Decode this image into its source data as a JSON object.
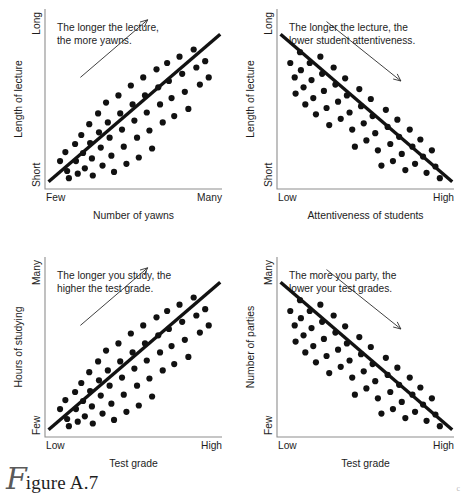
{
  "figure": {
    "caption_initial": "F",
    "caption_label": "igure A.7",
    "corner_mark": "c"
  },
  "panels": [
    {
      "id": "panel-length-vs-yawns",
      "caption_line1": "The longer the lecture,",
      "caption_line2": "the more yawns.",
      "y_axis_title": "Length of lecture",
      "y_top_label": "Long",
      "y_bottom_label": "Short",
      "x_axis_title": "Number of yawns",
      "x_left_label": "Few",
      "x_right_label": "Many",
      "direction": "positive",
      "arrow_name": "upward-trend-arrow"
    },
    {
      "id": "panel-length-vs-attentiveness",
      "caption_line1": "The longer the lecture, the",
      "caption_line2": "lower student attentiveness.",
      "y_axis_title": "Length of lecture",
      "y_top_label": "Long",
      "y_bottom_label": "Short",
      "x_axis_title": "Attentiveness of students",
      "x_left_label": "Low",
      "x_right_label": "High",
      "direction": "negative",
      "arrow_name": "downward-trend-arrow"
    },
    {
      "id": "panel-studying-vs-grade",
      "caption_line1": "The longer you study, the",
      "caption_line2": "higher the test grade.",
      "y_axis_title": "Hours of studying",
      "y_top_label": "Many",
      "y_bottom_label": "Few",
      "x_axis_title": "Test grade",
      "x_left_label": "Low",
      "x_right_label": "High",
      "direction": "positive",
      "arrow_name": "upward-trend-arrow"
    },
    {
      "id": "panel-parties-vs-grade",
      "caption_line1": "The more you party, the",
      "caption_line2": "lower your test grades.",
      "y_axis_title": "Number of parties",
      "y_top_label": "Many",
      "y_bottom_label": "Few",
      "x_axis_title": "Test grade",
      "x_left_label": "Low",
      "x_right_label": "High",
      "direction": "negative",
      "arrow_name": "downward-trend-arrow"
    }
  ],
  "chart_data": [
    {
      "type": "scatter",
      "title": "The longer the lecture, the more yawns.",
      "xlabel": "Number of yawns",
      "ylabel": "Length of lecture",
      "xlim": [
        0,
        1
      ],
      "ylim": [
        0,
        1
      ],
      "xtick_labels": [
        "Few",
        "Many"
      ],
      "ytick_labels": [
        "Short",
        "Long"
      ],
      "grid": false,
      "legend": "none",
      "correlation": "positive",
      "annotation": "upward arrow indicating positive correlation",
      "trendline": {
        "x": [
          0.02,
          0.99
        ],
        "y": [
          0.04,
          0.86
        ]
      },
      "points": [
        [
          0.085,
          0.155
        ],
        [
          0.115,
          0.205
        ],
        [
          0.125,
          0.1
        ],
        [
          0.135,
          0.06
        ],
        [
          0.17,
          0.25
        ],
        [
          0.175,
          0.155
        ],
        [
          0.185,
          0.085
        ],
        [
          0.205,
          0.3
        ],
        [
          0.215,
          0.2
        ],
        [
          0.225,
          0.115
        ],
        [
          0.25,
          0.36
        ],
        [
          0.255,
          0.255
        ],
        [
          0.265,
          0.17
        ],
        [
          0.27,
          0.075
        ],
        [
          0.3,
          0.42
        ],
        [
          0.305,
          0.315
        ],
        [
          0.315,
          0.23
        ],
        [
          0.325,
          0.13
        ],
        [
          0.345,
          0.48
        ],
        [
          0.355,
          0.37
        ],
        [
          0.365,
          0.285
        ],
        [
          0.375,
          0.185
        ],
        [
          0.39,
          0.095
        ],
        [
          0.415,
          0.52
        ],
        [
          0.425,
          0.42
        ],
        [
          0.435,
          0.33
        ],
        [
          0.445,
          0.235
        ],
        [
          0.46,
          0.14
        ],
        [
          0.485,
          0.575
        ],
        [
          0.495,
          0.47
        ],
        [
          0.505,
          0.38
        ],
        [
          0.52,
          0.285
        ],
        [
          0.53,
          0.175
        ],
        [
          0.555,
          0.62
        ],
        [
          0.565,
          0.52
        ],
        [
          0.575,
          0.425
        ],
        [
          0.59,
          0.325
        ],
        [
          0.605,
          0.225
        ],
        [
          0.63,
          0.665
        ],
        [
          0.64,
          0.565
        ],
        [
          0.65,
          0.47
        ],
        [
          0.665,
          0.37
        ],
        [
          0.69,
          0.7
        ],
        [
          0.7,
          0.6
        ],
        [
          0.715,
          0.505
        ],
        [
          0.73,
          0.405
        ],
        [
          0.76,
          0.735
        ],
        [
          0.775,
          0.64
        ],
        [
          0.79,
          0.54
        ],
        [
          0.81,
          0.445
        ],
        [
          0.84,
          0.775
        ],
        [
          0.855,
          0.675
        ],
        [
          0.875,
          0.58
        ],
        [
          0.905,
          0.71
        ],
        [
          0.925,
          0.62
        ]
      ]
    },
    {
      "type": "scatter",
      "title": "The longer the lecture, the lower student attentiveness.",
      "xlabel": "Attentiveness of students",
      "ylabel": "Length of lecture",
      "xlim": [
        0,
        1
      ],
      "ylim": [
        0,
        1
      ],
      "xtick_labels": [
        "Low",
        "High"
      ],
      "ytick_labels": [
        "Short",
        "Long"
      ],
      "grid": false,
      "legend": "none",
      "correlation": "negative",
      "annotation": "downward arrow indicating negative correlation",
      "trendline": {
        "x": [
          0.02,
          0.99
        ],
        "y": [
          0.86,
          0.04
        ]
      },
      "points": [
        [
          0.075,
          0.7
        ],
        [
          0.1,
          0.62
        ],
        [
          0.105,
          0.53
        ],
        [
          0.13,
          0.76
        ],
        [
          0.135,
          0.66
        ],
        [
          0.15,
          0.565
        ],
        [
          0.16,
          0.47
        ],
        [
          0.185,
          0.7
        ],
        [
          0.195,
          0.605
        ],
        [
          0.205,
          0.505
        ],
        [
          0.22,
          0.415
        ],
        [
          0.245,
          0.735
        ],
        [
          0.255,
          0.64
        ],
        [
          0.265,
          0.545
        ],
        [
          0.28,
          0.45
        ],
        [
          0.295,
          0.355
        ],
        [
          0.32,
          0.675
        ],
        [
          0.33,
          0.58
        ],
        [
          0.345,
          0.485
        ],
        [
          0.36,
          0.39
        ],
        [
          0.385,
          0.615
        ],
        [
          0.395,
          0.52
        ],
        [
          0.41,
          0.425
        ],
        [
          0.425,
          0.33
        ],
        [
          0.44,
          0.235
        ],
        [
          0.465,
          0.555
        ],
        [
          0.475,
          0.46
        ],
        [
          0.49,
          0.365
        ],
        [
          0.505,
          0.27
        ],
        [
          0.53,
          0.5
        ],
        [
          0.54,
          0.405
        ],
        [
          0.555,
          0.31
        ],
        [
          0.57,
          0.215
        ],
        [
          0.59,
          0.13
        ],
        [
          0.615,
          0.44
        ],
        [
          0.625,
          0.345
        ],
        [
          0.64,
          0.25
        ],
        [
          0.655,
          0.155
        ],
        [
          0.68,
          0.385
        ],
        [
          0.69,
          0.29
        ],
        [
          0.705,
          0.195
        ],
        [
          0.725,
          0.105
        ],
        [
          0.75,
          0.33
        ],
        [
          0.765,
          0.235
        ],
        [
          0.78,
          0.14
        ],
        [
          0.81,
          0.275
        ],
        [
          0.825,
          0.18
        ],
        [
          0.845,
          0.09
        ],
        [
          0.875,
          0.215
        ],
        [
          0.895,
          0.125
        ],
        [
          0.92,
          0.06
        ]
      ]
    },
    {
      "type": "scatter",
      "title": "The longer you study, the higher the test grade.",
      "xlabel": "Test grade",
      "ylabel": "Hours of studying",
      "xlim": [
        0,
        1
      ],
      "ylim": [
        0,
        1
      ],
      "xtick_labels": [
        "Low",
        "High"
      ],
      "ytick_labels": [
        "Few",
        "Many"
      ],
      "grid": false,
      "legend": "none",
      "correlation": "positive",
      "annotation": "upward arrow indicating positive correlation",
      "trendline": {
        "x": [
          0.02,
          0.99
        ],
        "y": [
          0.04,
          0.86
        ]
      },
      "points": [
        [
          0.085,
          0.155
        ],
        [
          0.115,
          0.205
        ],
        [
          0.125,
          0.1
        ],
        [
          0.135,
          0.06
        ],
        [
          0.17,
          0.25
        ],
        [
          0.175,
          0.155
        ],
        [
          0.185,
          0.085
        ],
        [
          0.205,
          0.3
        ],
        [
          0.215,
          0.2
        ],
        [
          0.225,
          0.115
        ],
        [
          0.25,
          0.36
        ],
        [
          0.255,
          0.255
        ],
        [
          0.265,
          0.17
        ],
        [
          0.27,
          0.075
        ],
        [
          0.3,
          0.42
        ],
        [
          0.305,
          0.315
        ],
        [
          0.315,
          0.23
        ],
        [
          0.325,
          0.13
        ],
        [
          0.345,
          0.48
        ],
        [
          0.355,
          0.37
        ],
        [
          0.365,
          0.285
        ],
        [
          0.375,
          0.185
        ],
        [
          0.39,
          0.095
        ],
        [
          0.415,
          0.52
        ],
        [
          0.425,
          0.42
        ],
        [
          0.435,
          0.33
        ],
        [
          0.445,
          0.235
        ],
        [
          0.46,
          0.14
        ],
        [
          0.485,
          0.575
        ],
        [
          0.495,
          0.47
        ],
        [
          0.505,
          0.38
        ],
        [
          0.52,
          0.285
        ],
        [
          0.53,
          0.175
        ],
        [
          0.555,
          0.62
        ],
        [
          0.565,
          0.52
        ],
        [
          0.575,
          0.425
        ],
        [
          0.59,
          0.325
        ],
        [
          0.605,
          0.225
        ],
        [
          0.63,
          0.665
        ],
        [
          0.64,
          0.565
        ],
        [
          0.65,
          0.47
        ],
        [
          0.665,
          0.37
        ],
        [
          0.69,
          0.7
        ],
        [
          0.7,
          0.6
        ],
        [
          0.715,
          0.505
        ],
        [
          0.73,
          0.405
        ],
        [
          0.76,
          0.735
        ],
        [
          0.775,
          0.64
        ],
        [
          0.79,
          0.54
        ],
        [
          0.81,
          0.445
        ],
        [
          0.84,
          0.775
        ],
        [
          0.855,
          0.675
        ],
        [
          0.875,
          0.58
        ],
        [
          0.905,
          0.71
        ],
        [
          0.925,
          0.62
        ]
      ]
    },
    {
      "type": "scatter",
      "title": "The more you party, the lower your test grades.",
      "xlabel": "Test grade",
      "ylabel": "Number of parties",
      "xlim": [
        0,
        1
      ],
      "ylim": [
        0,
        1
      ],
      "xtick_labels": [
        "Low",
        "High"
      ],
      "ytick_labels": [
        "Few",
        "Many"
      ],
      "grid": false,
      "legend": "none",
      "correlation": "negative",
      "annotation": "downward arrow indicating negative correlation",
      "trendline": {
        "x": [
          0.02,
          0.99
        ],
        "y": [
          0.86,
          0.04
        ]
      },
      "points": [
        [
          0.075,
          0.7
        ],
        [
          0.1,
          0.62
        ],
        [
          0.105,
          0.53
        ],
        [
          0.13,
          0.76
        ],
        [
          0.135,
          0.66
        ],
        [
          0.15,
          0.565
        ],
        [
          0.16,
          0.47
        ],
        [
          0.185,
          0.7
        ],
        [
          0.195,
          0.605
        ],
        [
          0.205,
          0.505
        ],
        [
          0.22,
          0.415
        ],
        [
          0.245,
          0.735
        ],
        [
          0.255,
          0.64
        ],
        [
          0.265,
          0.545
        ],
        [
          0.28,
          0.45
        ],
        [
          0.295,
          0.355
        ],
        [
          0.32,
          0.675
        ],
        [
          0.33,
          0.58
        ],
        [
          0.345,
          0.485
        ],
        [
          0.36,
          0.39
        ],
        [
          0.385,
          0.615
        ],
        [
          0.395,
          0.52
        ],
        [
          0.41,
          0.425
        ],
        [
          0.425,
          0.33
        ],
        [
          0.44,
          0.235
        ],
        [
          0.465,
          0.555
        ],
        [
          0.475,
          0.46
        ],
        [
          0.49,
          0.365
        ],
        [
          0.505,
          0.27
        ],
        [
          0.53,
          0.5
        ],
        [
          0.54,
          0.405
        ],
        [
          0.555,
          0.31
        ],
        [
          0.57,
          0.215
        ],
        [
          0.59,
          0.13
        ],
        [
          0.615,
          0.44
        ],
        [
          0.625,
          0.345
        ],
        [
          0.64,
          0.25
        ],
        [
          0.655,
          0.155
        ],
        [
          0.68,
          0.385
        ],
        [
          0.69,
          0.29
        ],
        [
          0.705,
          0.195
        ],
        [
          0.725,
          0.105
        ],
        [
          0.75,
          0.33
        ],
        [
          0.765,
          0.235
        ],
        [
          0.78,
          0.14
        ],
        [
          0.81,
          0.275
        ],
        [
          0.825,
          0.18
        ],
        [
          0.845,
          0.09
        ],
        [
          0.875,
          0.215
        ],
        [
          0.895,
          0.125
        ],
        [
          0.92,
          0.06
        ]
      ]
    }
  ]
}
